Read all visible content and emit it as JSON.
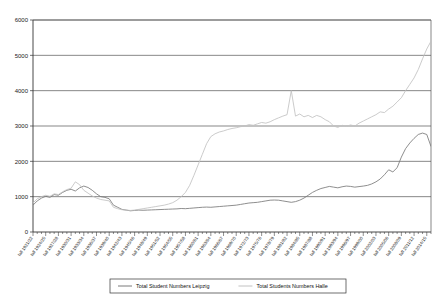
{
  "chart_data": {
    "type": "line",
    "title": "",
    "subtitle": "",
    "xlabel": "",
    "ylabel": "",
    "ylim": [
      0,
      6000
    ],
    "yticks": [
      "0",
      "1000",
      "2000",
      "3000",
      "4000",
      "5000",
      "6000"
    ],
    "grid": true,
    "grid_axis": "y",
    "legend_position": "bottom",
    "legend": [
      "Total Student Numbers Leipzig",
      "Total Students Numbers Halle"
    ],
    "series_colors": {
      "leipzig": "#7a7a7a",
      "halle": "#c2c2c2"
    },
    "xticks": [
      "fall 1921/22",
      "fall 1924/25",
      "fall 1927/28",
      "fall 1930/31",
      "fall 1933/34",
      "fall 1936/37",
      "fall 1939/40",
      "fall 1942/43",
      "fall 1945/46",
      "fall 1948/49",
      "fall 1951/52",
      "fall 1954/55",
      "fall 1957/58",
      "fall 1960/61",
      "fall 1963/64",
      "fall 1966/67",
      "fall 1969/70",
      "fall 1972/73",
      "fall 1975/76",
      "fall 1978/79",
      "fall 1981/82",
      "fall 1984/85",
      "fall 1987/88",
      "fall 1990/91",
      "fall 1993/94",
      "fall 1996/97",
      "fall 1999/00",
      "fall 2002/03",
      "fall 2005/06",
      "fall 2008/09",
      "fall 2011/12",
      "fall 2014/15"
    ],
    "x_start_year": 1921,
    "x_end_year": 2015,
    "x_tick_step_years": 3,
    "series": [
      {
        "name": "Total Student Numbers Leipzig",
        "color": "#7a7a7a",
        "values": [
          760,
          880,
          960,
          1010,
          980,
          1060,
          1040,
          1120,
          1180,
          1210,
          1160,
          1250,
          1300,
          1260,
          1180,
          1080,
          1000,
          980,
          940,
          760,
          700,
          640,
          620,
          600,
          610,
          620,
          615,
          620,
          625,
          630,
          635,
          640,
          645,
          650,
          655,
          665,
          660,
          670,
          680,
          690,
          700,
          705,
          700,
          710,
          720,
          730,
          740,
          750,
          760,
          780,
          800,
          820,
          830,
          840,
          860,
          880,
          900,
          905,
          900,
          880,
          860,
          840,
          860,
          900,
          960,
          1040,
          1120,
          1180,
          1230,
          1260,
          1290,
          1270,
          1250,
          1280,
          1300,
          1290,
          1270,
          1285,
          1300,
          1320,
          1360,
          1420,
          1500,
          1620,
          1760,
          1700,
          1820,
          2120,
          2360,
          2520,
          2650,
          2760,
          2800,
          2760,
          2420
        ]
      },
      {
        "name": "Total Students Numbers Halle",
        "color": "#c2c2c2",
        "values": [
          820,
          940,
          1000,
          1040,
          1010,
          1080,
          1060,
          1140,
          1200,
          1240,
          1420,
          1340,
          1180,
          1100,
          1020,
          960,
          920,
          900,
          880,
          700,
          660,
          630,
          620,
          610,
          620,
          640,
          660,
          680,
          700,
          720,
          740,
          760,
          790,
          830,
          900,
          1000,
          1120,
          1320,
          1600,
          1900,
          2200,
          2500,
          2700,
          2780,
          2830,
          2860,
          2900,
          2930,
          2950,
          2980,
          3000,
          3040,
          3020,
          3060,
          3100,
          3080,
          3120,
          3180,
          3230,
          3280,
          3320,
          4000,
          3280,
          3340,
          3260,
          3300,
          3240,
          3300,
          3260,
          3180,
          3120,
          3000,
          2960,
          3020,
          2990,
          3030,
          3000,
          3080,
          3140,
          3200,
          3260,
          3320,
          3400,
          3380,
          3480,
          3560,
          3680,
          3800,
          4000,
          4180,
          4360,
          4600,
          4900,
          5180,
          5400,
          5000
        ]
      }
    ]
  }
}
